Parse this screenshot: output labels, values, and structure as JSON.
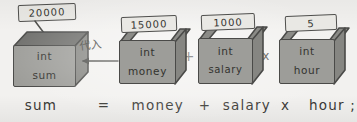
{
  "diagram": {
    "title_text": "",
    "assignment_label": "代入",
    "arrow_direction": "left",
    "colors": {
      "paper": "#f2f1ef",
      "box_front": "#9d9d99",
      "box_top_closed": "#6f6f6c",
      "box_side": "#868682",
      "tag_fill": "#e9e8e4",
      "ink": "#3a3a38"
    },
    "boxes": [
      {
        "id": "sum",
        "type_label": "int",
        "name_label": "sum",
        "value": "20000",
        "state": "closed",
        "tag_position": "above"
      },
      {
        "id": "money",
        "type_label": "int",
        "name_label": "money",
        "value": "15000",
        "state": "open",
        "tag_position": "inserted"
      },
      {
        "id": "salary",
        "type_label": "int",
        "name_label": "salary",
        "value": "1000",
        "state": "open",
        "tag_position": "inserted"
      },
      {
        "id": "hour",
        "type_label": "int",
        "name_label": "hour",
        "value": "5",
        "state": "open",
        "tag_position": "inserted"
      }
    ],
    "operators": {
      "plus": "+",
      "times": "x"
    },
    "equation": {
      "lhs": "sum",
      "equals": "=",
      "term1": "money",
      "op1": "+",
      "term2": "salary",
      "op2": "x",
      "term3": "hour ;"
    }
  }
}
